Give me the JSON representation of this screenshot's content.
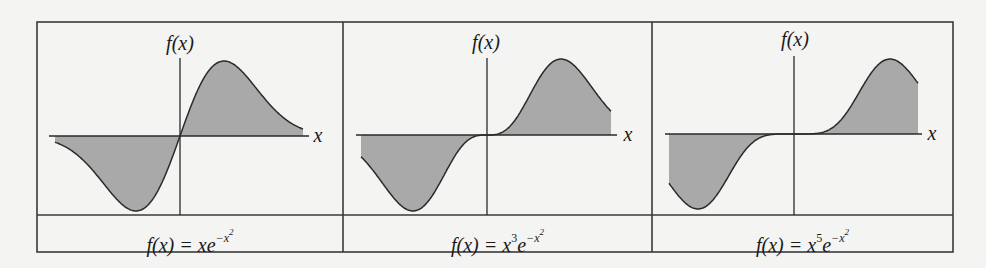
{
  "figure": {
    "panels": [
      {
        "id": "panel-1",
        "y_axis_label": "f(x)",
        "x_axis_label": "x",
        "formula": {
          "lhs": "f(x) = ",
          "base": "xe",
          "exp_prefix": "−x",
          "exp_power": "2",
          "x_power": ""
        },
        "function": "x*exp(-x^2)",
        "n": 1
      },
      {
        "id": "panel-2",
        "y_axis_label": "f(x)",
        "x_axis_label": "x",
        "formula": {
          "lhs": "f(x) = ",
          "base": "x",
          "x_power": "3",
          "e": "e",
          "exp_prefix": "−x",
          "exp_power": "2"
        },
        "function": "x^3*exp(-x^2)",
        "n": 3
      },
      {
        "id": "panel-3",
        "y_axis_label": "f(x)",
        "x_axis_label": "x",
        "formula": {
          "lhs": "f(x) = ",
          "base": "x",
          "x_power": "5",
          "e": "e",
          "exp_prefix": "−x",
          "exp_power": "2"
        },
        "function": "x^5*exp(-x^2)",
        "n": 5
      }
    ],
    "colors": {
      "fill": "#a9a9a9",
      "line": "#2a2a2a",
      "border": "#3a3a3a",
      "background": "#f4f4f2"
    }
  }
}
